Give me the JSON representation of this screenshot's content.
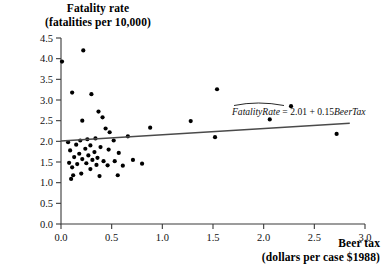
{
  "chart_data": {
    "type": "scatter",
    "title": "Fatality rate (fatalities per 10,000)",
    "title_lines": [
      "Fatality rate",
      "(fatalities per 10,000)"
    ],
    "xlabel": "Beer tax (dollars per case $1988)",
    "xlabel_lines": [
      "Beer tax",
      "(dollars per case $1988)"
    ],
    "ylabel": "Fatality rate (fatalities per 10,000)",
    "xlim": [
      0.0,
      3.0
    ],
    "ylim": [
      0.0,
      4.5
    ],
    "xticks": [
      "0.0",
      "0.5",
      "1.0",
      "1.5",
      "2.0",
      "2.5",
      "3.0"
    ],
    "xtick_values": [
      0.0,
      0.5,
      1.0,
      1.5,
      2.0,
      2.5,
      3.0
    ],
    "yticks": [
      "0.0",
      "0.5",
      "1.0",
      "1.5",
      "2.0",
      "2.5",
      "3.0",
      "3.5",
      "4.0",
      "4.5"
    ],
    "ytick_values": [
      0.0,
      0.5,
      1.0,
      1.5,
      2.0,
      2.5,
      3.0,
      3.5,
      4.0,
      4.5
    ],
    "grid": false,
    "legend": false,
    "marker_color": "#000000",
    "line_color": "#4a4a4a",
    "annotation": "FatalityRate = 2.01 + 0.15BeerTax",
    "annotation_parts": {
      "dependent": "FatalityRate",
      "equals": " = ",
      "intercept": "2.01",
      "plus": " + ",
      "slope": "0.15",
      "regressor": "BeerTax"
    },
    "fit": {
      "intercept": 2.01,
      "slope": 0.15,
      "x_start": 0.0,
      "x_end": 2.85,
      "y_start": 2.01,
      "y_end": 2.44
    },
    "series": [
      {
        "name": "states",
        "points": [
          [
            0.01,
            3.93
          ],
          [
            0.22,
            4.2
          ],
          [
            0.11,
            3.18
          ],
          [
            0.3,
            3.14
          ],
          [
            1.54,
            3.26
          ],
          [
            2.27,
            2.85
          ],
          [
            0.37,
            2.72
          ],
          [
            0.41,
            2.58
          ],
          [
            2.06,
            2.53
          ],
          [
            0.21,
            2.5
          ],
          [
            1.28,
            2.49
          ],
          [
            0.88,
            2.33
          ],
          [
            2.72,
            2.18
          ],
          [
            0.44,
            2.31
          ],
          [
            0.48,
            2.22
          ],
          [
            0.66,
            2.12
          ],
          [
            1.52,
            2.1
          ],
          [
            0.34,
            2.07
          ],
          [
            0.26,
            2.05
          ],
          [
            0.19,
            2.02
          ],
          [
            0.07,
            1.98
          ],
          [
            0.52,
            2.02
          ],
          [
            0.15,
            1.92
          ],
          [
            0.29,
            1.9
          ],
          [
            0.39,
            1.86
          ],
          [
            0.24,
            1.82
          ],
          [
            0.47,
            1.8
          ],
          [
            0.09,
            1.78
          ],
          [
            0.33,
            1.74
          ],
          [
            0.57,
            1.72
          ],
          [
            0.18,
            1.7
          ],
          [
            0.27,
            1.66
          ],
          [
            0.13,
            1.62
          ],
          [
            0.36,
            1.6
          ],
          [
            0.21,
            1.57
          ],
          [
            0.31,
            1.55
          ],
          [
            0.42,
            1.52
          ],
          [
            0.53,
            1.52
          ],
          [
            0.71,
            1.55
          ],
          [
            0.08,
            1.48
          ],
          [
            0.25,
            1.47
          ],
          [
            0.16,
            1.45
          ],
          [
            0.35,
            1.43
          ],
          [
            0.46,
            1.42
          ],
          [
            0.61,
            1.41
          ],
          [
            0.8,
            1.46
          ],
          [
            0.11,
            1.37
          ],
          [
            0.29,
            1.33
          ],
          [
            0.2,
            1.22
          ],
          [
            0.12,
            1.18
          ],
          [
            0.38,
            1.16
          ],
          [
            0.56,
            1.18
          ],
          [
            0.1,
            1.09
          ]
        ]
      }
    ]
  }
}
